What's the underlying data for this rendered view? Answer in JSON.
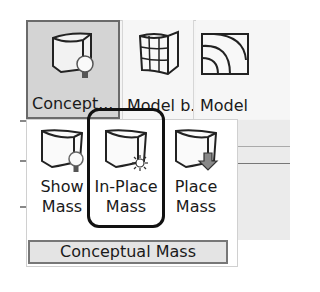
{
  "ribbon": {
    "buttons": [
      {
        "label": "Concept...",
        "icon": "conceptual-mass-icon",
        "state": "pressed"
      },
      {
        "label": "Model b...",
        "icon": "model-by-face-icon"
      },
      {
        "label": "Model",
        "icon": "model-line-icon"
      }
    ]
  },
  "panel": {
    "buttons": [
      {
        "line1": "Show",
        "line2": "Mass",
        "icon": "show-mass-icon"
      },
      {
        "line1": "In-Place",
        "line2": "Mass",
        "icon": "in-place-mass-icon",
        "highlighted": true
      },
      {
        "line1": "Place",
        "line2": "Mass",
        "icon": "place-mass-icon"
      }
    ],
    "title": "Conceptual Mass"
  },
  "colors": {
    "pressed_bg": "#d4d4d4",
    "highlight_border": "#111111",
    "footer_bg": "#e4e4e4"
  }
}
